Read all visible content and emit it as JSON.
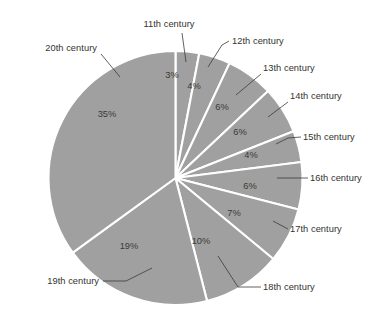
{
  "chart_data": {
    "type": "pie",
    "title": "",
    "subtitle": "",
    "xlabel": "",
    "ylabel": "",
    "legend_position": "none",
    "grid": false,
    "slice_color": "#a0a0a0",
    "slice_border_color": "#ffffff",
    "label_color": "#33332f",
    "leader_color": "#3a3a36",
    "background": "#ffffff",
    "start_angle_deg": 0,
    "direction": "clockwise",
    "units": "percent",
    "categories": [
      "11th century",
      "12th century",
      "13th century",
      "14th century",
      "15th century",
      "16th century",
      "17th century",
      "18th century",
      "19th century",
      "20th century"
    ],
    "values": [
      3,
      4,
      6,
      6,
      4,
      6,
      7,
      10,
      19,
      35
    ],
    "value_labels": [
      "3%",
      "4%",
      "6%",
      "6%",
      "4%",
      "6%",
      "7%",
      "10%",
      "19%",
      "35%"
    ],
    "slices": [
      {
        "label": "11th century",
        "value": 3,
        "value_label": "3%",
        "color": "#a0a0a0"
      },
      {
        "label": "12th century",
        "value": 4,
        "value_label": "4%",
        "color": "#a0a0a0"
      },
      {
        "label": "13th century",
        "value": 6,
        "value_label": "6%",
        "color": "#a0a0a0"
      },
      {
        "label": "14th century",
        "value": 6,
        "value_label": "6%",
        "color": "#a0a0a0"
      },
      {
        "label": "15th century",
        "value": 4,
        "value_label": "4%",
        "color": "#a0a0a0"
      },
      {
        "label": "16th century",
        "value": 6,
        "value_label": "6%",
        "color": "#a0a0a0"
      },
      {
        "label": "17th century",
        "value": 7,
        "value_label": "7%",
        "color": "#a0a0a0"
      },
      {
        "label": "18th century",
        "value": 10,
        "value_label": "10%",
        "color": "#a0a0a0"
      },
      {
        "label": "19th century",
        "value": 19,
        "value_label": "19%",
        "color": "#a0a0a0"
      },
      {
        "label": "20th century",
        "value": 35,
        "value_label": "35%",
        "color": "#a0a0a0"
      }
    ]
  },
  "geometry": {
    "cx": 175.5,
    "cy": 178,
    "r": 127
  },
  "callouts": [
    {
      "name": "callout-11th-century",
      "label": "11th century",
      "text_x": 169,
      "text_y": 27,
      "anchor": "middle",
      "path": "M 182,33 L 186,62"
    },
    {
      "name": "callout-12th-century",
      "label": "12th century",
      "text_x": 232,
      "text_y": 44,
      "anchor": "start",
      "path": "M 229,41 L 222,45 L 208,67"
    },
    {
      "name": "callout-13th-century",
      "label": "13th century",
      "text_x": 263,
      "text_y": 71,
      "anchor": "start",
      "path": "M 261,74 L 236,95"
    },
    {
      "name": "callout-14th-century",
      "label": "14th century",
      "text_x": 290,
      "text_y": 99,
      "anchor": "start",
      "path": "M 288,102 L 268,117"
    },
    {
      "name": "callout-15th-century",
      "label": "15th century",
      "text_x": 303,
      "text_y": 140,
      "anchor": "start",
      "path": "M 301,137 L 288,138 L 276,144"
    },
    {
      "name": "callout-16th-century",
      "label": "16th century",
      "text_x": 310,
      "text_y": 181,
      "anchor": "start",
      "path": "M 308,178 L 277,178"
    },
    {
      "name": "callout-17th-century",
      "label": "17th century",
      "text_x": 290,
      "text_y": 232,
      "anchor": "start",
      "path": "M 288,229 L 273,221"
    },
    {
      "name": "callout-18th-century",
      "label": "18th century",
      "text_x": 263,
      "text_y": 290,
      "anchor": "start",
      "path": "M 261,287 L 238,287 L 218,256"
    },
    {
      "name": "callout-19th-century",
      "label": "19th century",
      "text_x": 99,
      "text_y": 284,
      "anchor": "end",
      "path": "M 103,281 L 126,281 L 152,268"
    },
    {
      "name": "callout-20th-century",
      "label": "20th century",
      "text_x": 97,
      "text_y": 51,
      "anchor": "end",
      "path": "M 101,54 L 120,77"
    }
  ],
  "pct_positions": [
    {
      "name": "pct-11th-century",
      "x": 172,
      "y": 78,
      "value_label": "3%"
    },
    {
      "name": "pct-12th-century",
      "x": 194,
      "y": 89,
      "value_label": "4%"
    },
    {
      "name": "pct-13th-century",
      "x": 222,
      "y": 110,
      "value_label": "6%"
    },
    {
      "name": "pct-14th-century",
      "x": 240,
      "y": 135,
      "value_label": "6%"
    },
    {
      "name": "pct-15th-century",
      "x": 251,
      "y": 158,
      "value_label": "4%"
    },
    {
      "name": "pct-16th-century",
      "x": 250,
      "y": 189,
      "value_label": "6%"
    },
    {
      "name": "pct-17th-century",
      "x": 234,
      "y": 216,
      "value_label": "7%"
    },
    {
      "name": "pct-18th-century",
      "x": 201,
      "y": 244,
      "value_label": "10%"
    },
    {
      "name": "pct-19th-century",
      "x": 129,
      "y": 249,
      "value_label": "19%"
    },
    {
      "name": "pct-20th-century",
      "x": 107,
      "y": 117,
      "value_label": "35%"
    }
  ]
}
